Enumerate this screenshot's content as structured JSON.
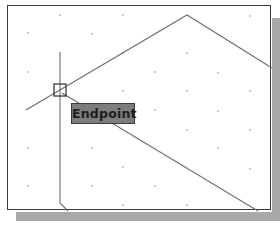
{
  "app": {
    "context": "CAD drawing viewport with object snap"
  },
  "snap_tooltip": {
    "label": "Endpoint"
  },
  "snap_marker": {
    "type": "endpoint-square",
    "center": [
      60,
      90
    ]
  },
  "colors": {
    "background": "#ffffff",
    "border": "#3a3a3a",
    "shadow": "#a9a9a9",
    "lines": "#6e6e6e",
    "tooltip_fill": "#7d7d7d",
    "grid_dots": "#8a8a8a"
  },
  "geometry": {
    "vertical_line": [
      [
        60,
        52
      ],
      [
        60,
        203
      ],
      [
        68,
        211
      ]
    ],
    "roof_line": [
      [
        26,
        110
      ],
      [
        187,
        15
      ],
      [
        272,
        68
      ]
    ],
    "lower_diagonal": [
      [
        62,
        93
      ],
      [
        258,
        211
      ]
    ]
  }
}
